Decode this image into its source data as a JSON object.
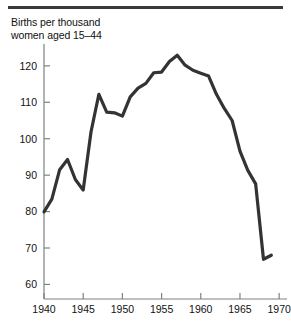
{
  "figure": {
    "title_line1": "Births per thousand",
    "title_line2": "women aged 15–44",
    "title_full": "Births per thousand\nwomen aged 15–44",
    "top_rule": "horizontal-rule"
  },
  "chart_data": {
    "type": "line",
    "title": "Births per thousand women aged 15–44",
    "xlabel": "",
    "ylabel": "Births per thousand women aged 15–44",
    "xlim": [
      1940,
      1971
    ],
    "ylim": [
      56,
      126
    ],
    "grid": false,
    "legend": null,
    "x_ticks": [
      1940,
      1945,
      1950,
      1955,
      1960,
      1965,
      1970
    ],
    "x_tick_labels": [
      "1940",
      "1945",
      "1950",
      "1955",
      "1960",
      "1965",
      "1970"
    ],
    "y_ticks": [
      60,
      70,
      80,
      90,
      100,
      110,
      120
    ],
    "y_tick_labels": [
      "60",
      "70",
      "80",
      "90",
      "100",
      "110",
      "120"
    ],
    "line_color": "#333333",
    "line_width": 3.2,
    "x": [
      1940,
      1941,
      1942,
      1943,
      1944,
      1945,
      1946,
      1947,
      1948,
      1949,
      1950,
      1951,
      1952,
      1953,
      1954,
      1955,
      1956,
      1957,
      1958,
      1959,
      1960,
      1961,
      1962,
      1963,
      1964,
      1965,
      1966,
      1967,
      1968,
      1969
    ],
    "values": [
      79.9,
      83.4,
      91.5,
      94.3,
      88.8,
      85.9,
      101.9,
      112.2,
      107.3,
      107.1,
      106.2,
      111.5,
      113.9,
      115.2,
      118.1,
      118.3,
      121.2,
      122.9,
      120.2,
      118.8,
      118.0,
      117.2,
      112.2,
      108.3,
      105.0,
      96.6,
      91.3,
      87.6,
      66.9,
      68.0
    ]
  }
}
